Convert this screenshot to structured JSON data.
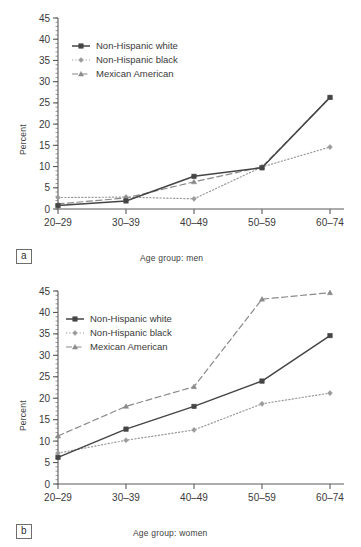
{
  "figure": {
    "panels": [
      {
        "tag": "a",
        "xlabel": "Age group: men",
        "ylabel": "Percent"
      },
      {
        "tag": "b",
        "xlabel": "Age group: women",
        "ylabel": "Percent"
      }
    ],
    "legend_labels": [
      "Non-Hispanic white",
      "Non-Hispanic black",
      "Mexican American"
    ],
    "colors": {
      "non_hispanic_white": "#454545",
      "non_hispanic_black": "#9a9a9a",
      "mexican_american": "#8a8a8a",
      "axis": "#5a5a5a",
      "text": "#3a3a3a"
    }
  },
  "chart_data": [
    {
      "type": "line",
      "title": "",
      "panel": "a",
      "xlabel": "Age group: men",
      "ylabel": "Percent",
      "categories": [
        "20–29",
        "30–39",
        "40–49",
        "50–59",
        "60–74"
      ],
      "ylim": [
        0,
        45
      ],
      "yticks": [
        0,
        5,
        10,
        15,
        20,
        25,
        30,
        35,
        40,
        45
      ],
      "ytick_labels": [
        "0",
        "5",
        "10",
        "15",
        "20",
        "25",
        "30",
        "35",
        "40",
        "45"
      ],
      "minor_tick_step": 1,
      "grid": false,
      "legend_position": "upper left",
      "series": [
        {
          "name": "Non-Hispanic white",
          "values": [
            0.8,
            1.9,
            7.7,
            9.7,
            26.3
          ],
          "line_style": "solid",
          "marker": "square",
          "color": "#454545"
        },
        {
          "name": "Non-Hispanic black",
          "values": [
            2.7,
            2.8,
            2.4,
            9.9,
            14.6
          ],
          "line_style": "dotted",
          "marker": "diamond",
          "color": "#9a9a9a"
        },
        {
          "name": "Mexican American",
          "values": [
            1.2,
            2.6,
            6.4,
            9.9,
            26.3
          ],
          "line_style": "dashed",
          "marker": "triangle",
          "color": "#8a8a8a"
        }
      ]
    },
    {
      "type": "line",
      "title": "",
      "panel": "b",
      "xlabel": "Age group: women",
      "ylabel": "Percent",
      "categories": [
        "20–29",
        "30–39",
        "40–49",
        "50–59",
        "60–74"
      ],
      "ylim": [
        0,
        45
      ],
      "yticks": [
        0,
        5,
        10,
        15,
        20,
        25,
        30,
        35,
        40,
        45
      ],
      "ytick_labels": [
        "0",
        "5",
        "10",
        "15",
        "20",
        "25",
        "30",
        "35",
        "40",
        "45"
      ],
      "minor_tick_step": 1,
      "grid": false,
      "legend_position": "upper left",
      "series": [
        {
          "name": "Non-Hispanic white",
          "values": [
            6.2,
            12.8,
            18.1,
            24.0,
            34.6
          ],
          "line_style": "solid",
          "marker": "square",
          "color": "#454545"
        },
        {
          "name": "Non-Hispanic black",
          "values": [
            7.2,
            10.2,
            12.6,
            18.7,
            21.2
          ],
          "line_style": "dotted",
          "marker": "diamond",
          "color": "#9a9a9a"
        },
        {
          "name": "Mexican American",
          "values": [
            11.2,
            18.1,
            22.7,
            43.1,
            44.6
          ],
          "line_style": "dashed",
          "marker": "triangle",
          "color": "#8a8a8a"
        }
      ]
    }
  ]
}
